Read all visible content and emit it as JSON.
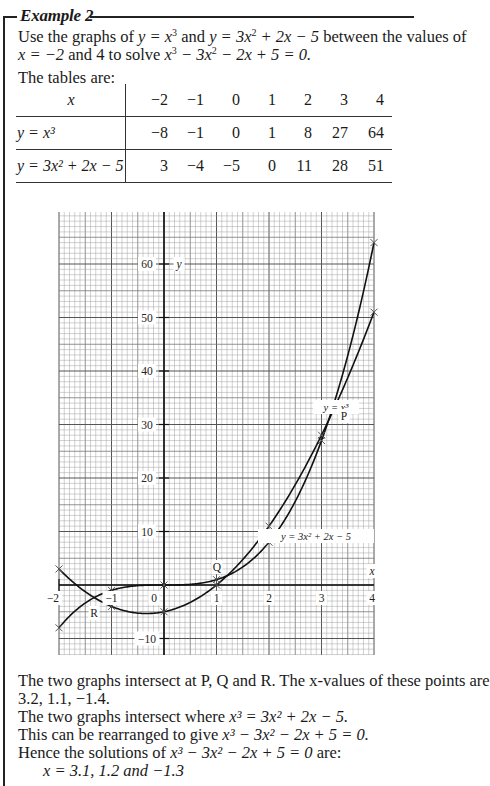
{
  "example": {
    "title": "Example 2",
    "intro_line1_pre": "Use the graphs of ",
    "intro_line1_eq1": "y = x",
    "intro_line1_mid": " and ",
    "intro_line1_eq2": "y = 3x",
    "intro_line1_eq2b": " + 2x − 5",
    "intro_line1_post": " between the values of",
    "intro_line2_a": "x = −2",
    "intro_line2_b": " and 4 to solve ",
    "intro_line2_eq": "x",
    "intro_line2_eq_b": " − 3x",
    "intro_line2_eq_c": " − 2x + 5 = 0.",
    "tables_intro": "The tables are:"
  },
  "table": {
    "header_label": "x",
    "x_values": [
      "−2",
      "−1",
      "0",
      "1",
      "2",
      "3",
      "4"
    ],
    "rows": [
      {
        "label": "y = x³",
        "values": [
          "−8",
          "−1",
          "0",
          "1",
          "8",
          "27",
          "64"
        ]
      },
      {
        "label": "y = 3x² + 2x − 5",
        "values": [
          "3",
          "−4",
          "−5",
          "0",
          "11",
          "28",
          "51"
        ]
      }
    ]
  },
  "chart_data": {
    "type": "line",
    "title": "",
    "xlabel": "x",
    "ylabel": "y",
    "xlim": [
      -2,
      4
    ],
    "ylim": [
      -13,
      70
    ],
    "grid": true,
    "x_ticks": [
      "−2",
      "−1",
      "0",
      "1",
      "2",
      "3",
      "4"
    ],
    "y_ticks": [
      "−10",
      "10",
      "20",
      "30",
      "40",
      "50",
      "60"
    ],
    "x": [
      -2,
      -1,
      0,
      1,
      2,
      3,
      4
    ],
    "series": [
      {
        "name": "y = x³",
        "values": [
          -8,
          -1,
          0,
          1,
          8,
          27,
          64
        ]
      },
      {
        "name": "y = 3x² + 2x − 5",
        "values": [
          3,
          -4,
          -5,
          0,
          11,
          28,
          51
        ]
      }
    ],
    "annotations": [
      {
        "label": "P",
        "x": 3.2,
        "y": 31
      },
      {
        "label": "Q",
        "x": 1.1,
        "y": 1.3
      },
      {
        "label": "R",
        "x": -1.4,
        "y": -2.7
      }
    ],
    "curve_labels": [
      "y = x³",
      "y = 3x² + 2x − 5"
    ]
  },
  "conclusion": {
    "line1": "The two graphs intersect at P, Q and R. The x-values of these points are",
    "line2": "3.2, 1.1, −1.4.",
    "line3_pre": "The two graphs intersect where ",
    "line3_eq": "x³ = 3x² + 2x − 5.",
    "line4_pre": "This can be rearranged to give ",
    "line4_eq": "x³ − 3x² − 2x + 5 = 0.",
    "line5_pre": "Hence the solutions of ",
    "line5_eq": "x³ − 3x² − 2x + 5 = 0",
    "line5_post": " are:",
    "line6": "x = 3.1, 1.2 and −1.3"
  }
}
